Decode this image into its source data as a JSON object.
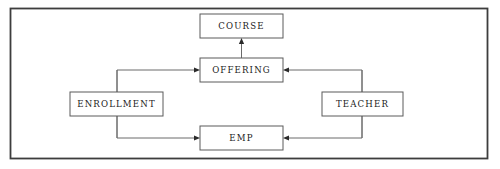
{
  "diagram": {
    "type": "entity-relationship-diagram",
    "frame": {
      "name": "outer-border",
      "x": 10.5,
      "y": 8.5,
      "width": 477,
      "height": 150
    },
    "entities": [
      {
        "id": "course",
        "label": "COURSE",
        "x": 200,
        "y": 14,
        "width": 83,
        "height": 24
      },
      {
        "id": "offering",
        "label": "OFFERING",
        "x": 200,
        "y": 58,
        "width": 83,
        "height": 24
      },
      {
        "id": "enrollment",
        "label": "ENROLLMENT",
        "x": 70,
        "y": 92,
        "width": 93,
        "height": 24
      },
      {
        "id": "teacher",
        "label": "TEACHER",
        "x": 322,
        "y": 92,
        "width": 81,
        "height": 24
      },
      {
        "id": "emp",
        "label": "EMP",
        "x": 200,
        "y": 126,
        "width": 83,
        "height": 24
      }
    ],
    "connectors": [
      {
        "id": "offering-to-course",
        "from": "offering",
        "to": "course",
        "path": "M 241.5 58 L 241.5 42",
        "arrow": {
          "x": 241.5,
          "y": 38,
          "direction": "up"
        }
      },
      {
        "id": "enrollment-to-offering",
        "from": "enrollment",
        "to": "offering",
        "path": "M 117 138 L 117 70 L 196 70",
        "arrow": {
          "x": 200,
          "y": 70,
          "direction": "right"
        }
      },
      {
        "id": "enrollment-to-emp",
        "from": "enrollment",
        "to": "emp",
        "path": "M 117 70 L 117 138 L 196 138",
        "arrow": {
          "x": 200,
          "y": 138,
          "direction": "right"
        }
      },
      {
        "id": "teacher-to-offering",
        "from": "teacher",
        "to": "offering",
        "path": "M 362 138 L 362 70 L 287 70",
        "arrow": {
          "x": 283,
          "y": 70,
          "direction": "left"
        }
      },
      {
        "id": "teacher-to-emp",
        "from": "teacher",
        "to": "emp",
        "path": "M 362 70 L 362 138 L 287 138",
        "arrow": {
          "x": 283,
          "y": 138,
          "direction": "left"
        }
      }
    ],
    "colors": {
      "background": "#ffffff",
      "box_stroke": "#5a5a5a",
      "connector_stroke": "#6a6a6a",
      "arrow_fill": "#2a2a2a",
      "frame_stroke": "#3d3d3d",
      "text": "#1a1a1a"
    }
  }
}
